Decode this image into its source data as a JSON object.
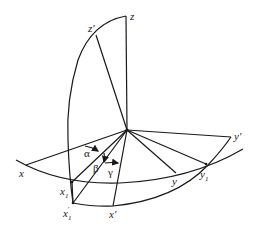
{
  "diagram": {
    "type": "spherical-coordinate-rotation",
    "labels": {
      "z": "z",
      "z_prime": "z′",
      "x": "x",
      "x1": "x",
      "x1_sub": "1",
      "x1_prime": "x",
      "x1_prime_sub": "1",
      "x1_prime_mark": "′",
      "x_prime": "x′",
      "y": "y",
      "y1": "y",
      "y1_sub": "1",
      "y_prime": "y′",
      "alpha": "α",
      "beta": "β",
      "gamma": "γ"
    }
  }
}
